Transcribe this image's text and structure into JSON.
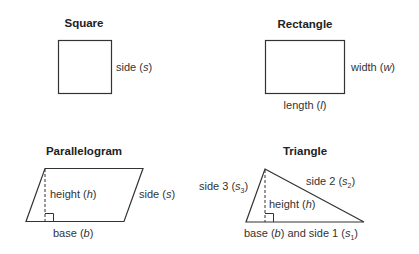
{
  "shapes": {
    "square": {
      "title": "Square",
      "side_label": "side (",
      "side_var": "s",
      "side_close": ")"
    },
    "rectangle": {
      "title": "Rectangle",
      "width_label": "width (",
      "width_var": "w",
      "width_close": ")",
      "length_label": "length (",
      "length_var": "l",
      "length_close": ")"
    },
    "parallelogram": {
      "title": "Parallelogram",
      "height_label": "height (",
      "height_var": "h",
      "height_close": ")",
      "side_label": "side (",
      "side_var": "s",
      "side_close": ")",
      "base_label": "base (",
      "base_var": "b",
      "base_close": ")"
    },
    "triangle": {
      "title": "Triangle",
      "side3_label": "side 3 (",
      "side3_var": "s",
      "side3_sub": "3",
      "side3_close": ")",
      "side2_label": "side 2 (",
      "side2_var": "s",
      "side2_sub": "2",
      "side2_close": ")",
      "height_label": "height (",
      "height_var": "h",
      "height_close": ")",
      "base_label": "base (",
      "base_var": "b",
      "base_mid": ") and side 1 (",
      "side1_var": "s",
      "side1_sub": "1",
      "side1_close": ")"
    }
  },
  "colors": {
    "stroke": "#333333",
    "text": "#333333",
    "background": "#ffffff"
  }
}
